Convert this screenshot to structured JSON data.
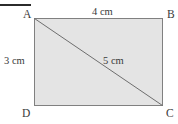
{
  "figure": {
    "type": "rectangle-with-diagonal",
    "shape_name": "ABCD",
    "fill_color": "#e4e4e4",
    "stroke_color": "#808080",
    "diagonal_color": "#6e6e6e",
    "rule_color": "#2b2b2b",
    "text_color": "#3a3a3a",
    "rect": {
      "x": 34,
      "y": 18,
      "width": 129,
      "height": 88
    },
    "diagonal": {
      "x1": 34,
      "y1": 18,
      "x2": 163,
      "y2": 106
    },
    "top_rule": {
      "x": 0,
      "y": 4,
      "width": 31,
      "height": 2
    }
  },
  "vertices": {
    "a": "A",
    "b": "B",
    "c": "C",
    "d": "D"
  },
  "measures": {
    "top_side": "4 cm",
    "left_side": "3 cm",
    "diagonal": "5 cm"
  }
}
